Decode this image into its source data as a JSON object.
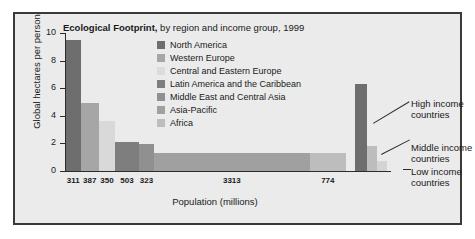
{
  "chart_data": {
    "type": "bar",
    "title_bold": "Ecological Footprint,",
    "title_rest": " by region and income group, 1999",
    "xlabel": "Population (millions)",
    "ylabel": "Global hectares per person",
    "ylim": [
      0,
      10
    ],
    "yticks": [
      0,
      2,
      4,
      6,
      8,
      10
    ],
    "ytick_labels": [
      "0",
      "2",
      "4",
      "6",
      "8",
      "10"
    ],
    "grid": false,
    "legend_position": "inside-top-center",
    "note": "Variable-width (Marimekko) bar chart: bar width is population, bar height is footprint per person.",
    "categories": [
      "North America",
      "Western Europe",
      "Central and Eastern Europe",
      "Latin America and the Caribbean",
      "Middle East and Central Asia",
      "Asia-Pacific",
      "Africa"
    ],
    "values": [
      9.5,
      4.9,
      3.6,
      2.1,
      1.95,
      1.3,
      1.3
    ],
    "widths_population_millions": [
      311,
      387,
      350,
      503,
      323,
      3313,
      774
    ],
    "xtick_labels": [
      "311",
      "387",
      "350",
      "503",
      "323",
      "3313",
      "774"
    ],
    "colors": [
      "#6e6e6e",
      "#a6a6a6",
      "#d9d9d9",
      "#7e7e7e",
      "#909090",
      "#a0a0a0",
      "#bdbdbd"
    ],
    "income_groups": {
      "categories": [
        "High income countries",
        "Middle income countries",
        "Low income countries"
      ],
      "values": [
        6.4,
        1.9,
        0.8
      ],
      "colors": [
        "#6e6e6e",
        "#bdbdbd",
        "#d4d4d4"
      ]
    }
  },
  "legend": {
    "items": [
      {
        "label": "North America",
        "color": "#6e6e6e"
      },
      {
        "label": "Western Europe",
        "color": "#a6a6a6"
      },
      {
        "label": "Central and Eastern Europe",
        "color": "#dcdcdc"
      },
      {
        "label": "Latin America and the Caribbean",
        "color": "#7e7e7e"
      },
      {
        "label": "Middle East and Central Asia",
        "color": "#909090"
      },
      {
        "label": "Asia-Pacific",
        "color": "#a0a0a0"
      },
      {
        "label": "Africa",
        "color": "#bdbdbd"
      }
    ]
  },
  "annotations": {
    "high": {
      "line1": "High income",
      "line2": "countries"
    },
    "middle": {
      "line1": "Middle income",
      "line2": "countries"
    },
    "low": {
      "line1": "Low income",
      "line2": "countries"
    }
  }
}
